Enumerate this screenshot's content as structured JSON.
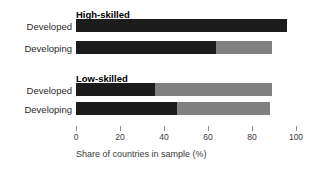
{
  "chart_data": {
    "type": "bar",
    "orientation": "horizontal",
    "stacked": true,
    "title": "",
    "xlabel": "Share of countries in sample (%)",
    "ylabel": "",
    "xlim": [
      0,
      100
    ],
    "xticks": [
      0,
      20,
      40,
      60,
      80,
      100
    ],
    "xticklabels": [
      "0",
      "20",
      "40",
      "60",
      "80",
      "100"
    ],
    "grid": false,
    "legend": "none",
    "colors": {
      "segment_dark": "#1c1c1c",
      "segment_light": "#808080",
      "axis": "#8a8a8a",
      "text": "#3a3a3a"
    },
    "groups": [
      {
        "name": "High-skilled",
        "bars": [
          {
            "category": "Developed",
            "segments": [
              96.0
            ]
          },
          {
            "category": "Developing",
            "segments": [
              63.5,
              25.5
            ]
          }
        ]
      },
      {
        "name": "Low-skilled",
        "bars": [
          {
            "category": "Developed",
            "segments": [
              36.0,
              53.0
            ]
          },
          {
            "category": "Developing",
            "segments": [
              46.0,
              42.0
            ]
          }
        ]
      }
    ]
  },
  "labels": {
    "group_high": "High-skilled",
    "group_low": "Low-skilled",
    "developed": "Developed",
    "developing": "Developing"
  },
  "axis": {
    "title": "Share of countries in sample (%)",
    "t0": "0",
    "t1": "20",
    "t2": "40",
    "t3": "60",
    "t4": "80",
    "t5": "100"
  }
}
